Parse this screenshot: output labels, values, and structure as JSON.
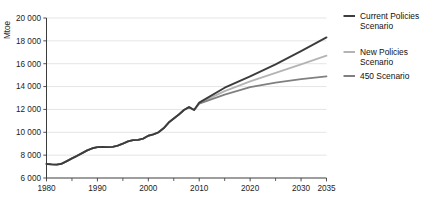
{
  "chart_data": {
    "type": "line",
    "title": "",
    "xlabel": "",
    "ylabel": "Mtoe",
    "xlim": [
      1980,
      2035
    ],
    "ylim": [
      6000,
      20000
    ],
    "grid": true,
    "legend_position": "right",
    "y_ticks": [
      6000,
      8000,
      10000,
      12000,
      14000,
      16000,
      18000,
      20000
    ],
    "y_tick_labels": [
      "6 000",
      "8 000",
      "10 000",
      "12 000",
      "14 000",
      "16 000",
      "18 000",
      "20 000"
    ],
    "x_ticks": [
      1980,
      1990,
      2000,
      2010,
      2020,
      2030,
      2035
    ],
    "x_tick_labels": [
      "1980",
      "1990",
      "2000",
      "2010",
      "2020",
      "2030",
      "2035"
    ],
    "x_minor_ticks": [
      1985,
      1995,
      2005,
      2015,
      2025
    ],
    "series": [
      {
        "name": "Current Policies Scenario",
        "color": "#3c3c3c",
        "width": 1.9,
        "x": [
          1980,
          1981,
          1982,
          1983,
          1984,
          1985,
          1986,
          1987,
          1988,
          1989,
          1990,
          1991,
          1992,
          1993,
          1994,
          1995,
          1996,
          1997,
          1998,
          1999,
          2000,
          2001,
          2002,
          2003,
          2004,
          2005,
          2006,
          2007,
          2008,
          2009,
          2010,
          2015,
          2020,
          2025,
          2030,
          2035
        ],
        "values": [
          7230,
          7190,
          7170,
          7250,
          7480,
          7720,
          7940,
          8180,
          8420,
          8600,
          8700,
          8710,
          8700,
          8720,
          8830,
          9000,
          9200,
          9310,
          9340,
          9450,
          9700,
          9820,
          10000,
          10350,
          10850,
          11200,
          11550,
          11950,
          12200,
          11950,
          12600,
          13900,
          14900,
          15950,
          17100,
          18300
        ]
      },
      {
        "name": "New Policies Scenario",
        "color": "#b4b4b4",
        "width": 1.8,
        "x": [
          1980,
          1981,
          1982,
          1983,
          1984,
          1985,
          1986,
          1987,
          1988,
          1989,
          1990,
          1991,
          1992,
          1993,
          1994,
          1995,
          1996,
          1997,
          1998,
          1999,
          2000,
          2001,
          2002,
          2003,
          2004,
          2005,
          2006,
          2007,
          2008,
          2009,
          2010,
          2015,
          2020,
          2025,
          2030,
          2035
        ],
        "values": [
          7230,
          7190,
          7170,
          7250,
          7480,
          7720,
          7940,
          8180,
          8420,
          8600,
          8700,
          8710,
          8700,
          8720,
          8830,
          9000,
          9200,
          9310,
          9340,
          9450,
          9700,
          9820,
          10000,
          10350,
          10850,
          11200,
          11550,
          11950,
          12200,
          11950,
          12550,
          13600,
          14450,
          15200,
          15950,
          16700
        ]
      },
      {
        "name": "450 Scenario",
        "color": "#808080",
        "width": 1.8,
        "x": [
          1980,
          1981,
          1982,
          1983,
          1984,
          1985,
          1986,
          1987,
          1988,
          1989,
          1990,
          1991,
          1992,
          1993,
          1994,
          1995,
          1996,
          1997,
          1998,
          1999,
          2000,
          2001,
          2002,
          2003,
          2004,
          2005,
          2006,
          2007,
          2008,
          2009,
          2010,
          2015,
          2020,
          2025,
          2030,
          2035
        ],
        "values": [
          7230,
          7190,
          7170,
          7250,
          7480,
          7720,
          7940,
          8180,
          8420,
          8600,
          8700,
          8710,
          8700,
          8720,
          8830,
          9000,
          9200,
          9310,
          9340,
          9450,
          9700,
          9820,
          10000,
          10350,
          10850,
          11200,
          11550,
          11950,
          12200,
          11950,
          12500,
          13300,
          13950,
          14350,
          14650,
          14900
        ]
      }
    ]
  },
  "legend": {
    "items": [
      {
        "label_line1": "Current Policies",
        "label_line2": "Scenario",
        "color": "#3c3c3c"
      },
      {
        "label_line1": "New Policies",
        "label_line2": "Scenario",
        "color": "#b4b4b4"
      },
      {
        "label_line1": "450 Scenario",
        "label_line2": "",
        "color": "#808080"
      }
    ]
  }
}
